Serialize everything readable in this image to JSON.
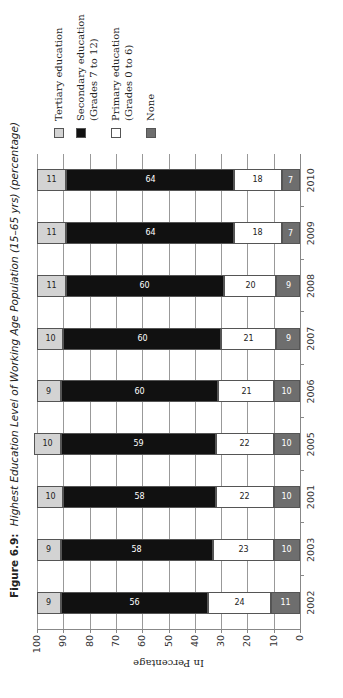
{
  "figure": {
    "number": "Figure 6.9:",
    "title": "Highest Education Level of Working Age Population (15–65 yrs) (percentage)"
  },
  "chart_data": {
    "type": "bar",
    "stacked": true,
    "orientation": "vertical (page printed rotated 90° counter-clockwise)",
    "title": "Highest Education Level of Working Age Population (15–65 yrs) (percentage)",
    "xlabel": "",
    "ylabel": "In Percentage",
    "ylim": [
      0,
      100
    ],
    "yticks": [
      0,
      10,
      20,
      30,
      40,
      50,
      60,
      70,
      80,
      90,
      100
    ],
    "grid": true,
    "legend_position": "right",
    "categories": [
      "2002",
      "2003",
      "2001",
      "2005",
      "2006",
      "2007",
      "2008",
      "2009",
      "2010"
    ],
    "series": [
      {
        "name": "None",
        "color": "#6e6e6e",
        "label_color": "#ffffff",
        "values": [
          11,
          10,
          10,
          10,
          10,
          9,
          9,
          7,
          7
        ]
      },
      {
        "name": "Primary education (Grades 0 to 6)",
        "color": "#ffffff",
        "label_color": "#222222",
        "values": [
          24,
          23,
          22,
          22,
          21,
          21,
          20,
          18,
          18
        ]
      },
      {
        "name": "Secondary education (Grades 7 to 12)",
        "color": "#111111",
        "label_color": "#ffffff",
        "values": [
          56,
          58,
          58,
          59,
          60,
          60,
          60,
          64,
          64
        ]
      },
      {
        "name": "Tertiary education",
        "color": "#d3d3d3",
        "label_color": "#222222",
        "values": [
          9,
          9,
          10,
          10,
          9,
          10,
          11,
          11,
          11
        ]
      }
    ]
  },
  "legend": [
    {
      "line1": "Tertiary education",
      "line2": "",
      "color": "#d3d3d3"
    },
    {
      "line1": "Secondary education",
      "line2": "(Grades 7 to 12)",
      "color": "#111111"
    },
    {
      "line1": "Primary education",
      "line2": "(Grades 0 to 6)",
      "color": "#ffffff"
    },
    {
      "line1": "None",
      "line2": "",
      "color": "#6e6e6e"
    }
  ]
}
